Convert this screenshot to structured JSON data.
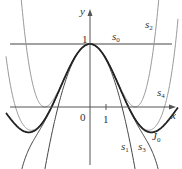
{
  "chart_data": {
    "type": "line",
    "title": "",
    "xlabel": "x",
    "ylabel": "y",
    "xlim": [
      -5.0,
      5.3
    ],
    "ylim": [
      -0.95,
      1.55
    ],
    "grid": false,
    "legend": "inline labels",
    "tick_labels": {
      "origin": "0",
      "x_tick": "1",
      "y_tick": "1"
    },
    "series": [
      {
        "name": "s0",
        "label": "s",
        "sub": "0",
        "color": "#444444",
        "width": 1.0,
        "formula": "1",
        "coef": [
          1
        ]
      },
      {
        "name": "s1",
        "label": "s",
        "sub": "1",
        "color": "#444444",
        "width": 1.0,
        "formula": "1 - x^2/4",
        "coef": [
          1,
          -0.25
        ]
      },
      {
        "name": "s2",
        "label": "s",
        "sub": "2",
        "color": "#9a9a9a",
        "width": 1.0,
        "formula": "1 - x^2/4 + x^4/64",
        "coef": [
          1,
          -0.25,
          0.015625
        ]
      },
      {
        "name": "s3",
        "label": "s",
        "sub": "3",
        "color": "#444444",
        "width": 1.0,
        "formula": "1 - x^2/4 + x^4/64 - x^6/2304",
        "coef": [
          1,
          -0.25,
          0.015625,
          -0.000434028
        ]
      },
      {
        "name": "s4",
        "label": "s",
        "sub": "4",
        "color": "#9a9a9a",
        "width": 1.0,
        "formula": "1 - x^2/4 + x^4/64 - x^6/2304 + x^8/147456",
        "coef": [
          1,
          -0.25,
          0.015625,
          -0.000434028,
          6.78168e-06
        ]
      },
      {
        "name": "J0",
        "label": "J",
        "sub": "0",
        "color": "#222222",
        "width": 1.8,
        "formula": "Bessel J0(x)",
        "coef": [
          1,
          -0.25,
          0.015625,
          -0.000434028,
          6.78168e-06,
          -6.78168e-08,
          4.7095e-10
        ]
      }
    ],
    "labels_pos": {
      "s0": [
        112,
        40
      ],
      "s1": [
        121,
        150
      ],
      "s2": [
        145,
        28
      ],
      "s3": [
        138,
        150
      ],
      "s4": [
        157,
        96
      ],
      "J0": [
        152,
        140
      ]
    }
  },
  "axes": {
    "x_label": "x",
    "y_label": "y",
    "origin": "0",
    "x_tick": "1",
    "y_tick": "1"
  }
}
